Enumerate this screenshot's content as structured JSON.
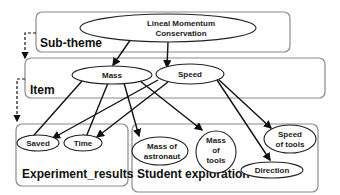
{
  "diagram": {
    "groups": {
      "sub_theme": "Sub-theme",
      "item": "Item",
      "experiment_results": "Experiment_results",
      "student_exploration": "Student exploration"
    },
    "nodes": {
      "root_line1": "Lineal Momentum",
      "root_line2": "Conservation",
      "mass": "Mass",
      "speed": "Speed",
      "saved": "Saved",
      "time": "Time",
      "mass_astronaut_line1": "Mass of",
      "mass_astronaut_line2": "astronaut",
      "mass_tools_line1": "Mass",
      "mass_tools_line2": "of",
      "mass_tools_line3": "tools",
      "speed_tools_line1": "Speed",
      "speed_tools_line2": "of tools",
      "direction": "Direction"
    },
    "edges": [
      [
        "Lineal Momentum Conservation",
        "Mass"
      ],
      [
        "Lineal Momentum Conservation",
        "Speed"
      ],
      [
        "Mass",
        "Saved"
      ],
      [
        "Mass",
        "Time"
      ],
      [
        "Mass",
        "Mass of astronaut"
      ],
      [
        "Mass",
        "Mass of tools"
      ],
      [
        "Speed",
        "Saved"
      ],
      [
        "Speed",
        "Time"
      ],
      [
        "Speed",
        "Speed of tools"
      ],
      [
        "Speed",
        "Direction"
      ],
      [
        "Sub-theme",
        "Item",
        "dashed"
      ],
      [
        "Item",
        "Experiment_results",
        "dashed"
      ]
    ]
  }
}
